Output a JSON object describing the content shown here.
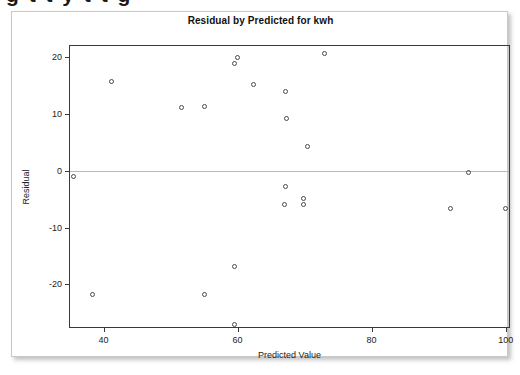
{
  "page": {
    "cut_off_heading": "g    t   t   y  t  t    g"
  },
  "chart_data": {
    "type": "scatter",
    "title": "Residual by Predicted for kwh",
    "xlabel": "Predicted Value",
    "ylabel": "Residual",
    "xlim": [
      35,
      100.5
    ],
    "ylim": [
      -27.5,
      22
    ],
    "xticks": [
      40,
      60,
      80,
      100
    ],
    "yticks": [
      20,
      10,
      0,
      -10,
      -20
    ],
    "grid": false,
    "legend": null,
    "reference_lines": [
      {
        "axis": "y",
        "value": 0,
        "color": "#b9b9b9"
      }
    ],
    "marker": {
      "shape": "open-circle",
      "color": "#4a4a4a",
      "size": 5
    },
    "x": [
      35.5,
      38.3,
      41.2,
      51.6,
      55.0,
      55.0,
      59.5,
      59.5,
      59.5,
      60.0,
      62.4,
      67.2,
      67.2,
      67.2,
      68.0,
      69.8,
      69.8,
      70.5,
      72.9,
      91.7,
      94.4,
      100.0
    ],
    "y": [
      -1.0,
      -21.7,
      15.8,
      11.1,
      11.4,
      -21.8,
      18.9,
      -16.8,
      -27.0,
      0.0,
      15.3,
      14.0,
      9.3,
      -2.8,
      -6.0,
      -4.8,
      -5.9,
      4.3,
      20.7,
      -7.0,
      -0.4,
      -7.0
    ],
    "points": [
      {
        "x": 35.5,
        "y": -1.0
      },
      {
        "x": 38.3,
        "y": -21.7
      },
      {
        "x": 41.2,
        "y": 15.8
      },
      {
        "x": 51.6,
        "y": 11.1
      },
      {
        "x": 55.0,
        "y": 11.4
      },
      {
        "x": 55.0,
        "y": -21.8
      },
      {
        "x": 59.5,
        "y": 18.9
      },
      {
        "x": 59.6,
        "y": -16.8
      },
      {
        "x": 59.6,
        "y": -27.0
      },
      {
        "x": 62.4,
        "y": 15.3
      },
      {
        "x": 67.2,
        "y": 14.0
      },
      {
        "x": 67.3,
        "y": 9.3
      },
      {
        "x": 67.2,
        "y": -2.8
      },
      {
        "x": 67.0,
        "y": -6.0
      },
      {
        "x": 69.8,
        "y": -4.8
      },
      {
        "x": 69.8,
        "y": -5.9
      },
      {
        "x": 70.5,
        "y": 4.3
      },
      {
        "x": 72.9,
        "y": 20.7
      },
      {
        "x": 91.7,
        "y": -6.6
      },
      {
        "x": 94.4,
        "y": -0.2
      },
      {
        "x": 100.0,
        "y": -6.6
      },
      {
        "x": 60.0,
        "y": 20.0
      }
    ]
  }
}
